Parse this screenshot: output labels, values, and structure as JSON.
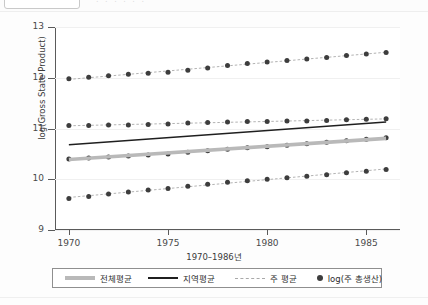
{
  "chart_data": {
    "type": "scatter",
    "title": "",
    "xlabel": "1970–1986년",
    "ylabel": "log(Gross State Product)",
    "xlim": [
      1969.3,
      1986.7
    ],
    "ylim": [
      9,
      13
    ],
    "x": [
      1970,
      1971,
      1972,
      1973,
      1974,
      1975,
      1976,
      1977,
      1978,
      1979,
      1980,
      1981,
      1982,
      1983,
      1984,
      1985,
      1986
    ],
    "xticks": [
      "1970",
      "1975",
      "1980",
      "1985"
    ],
    "xtick_values": [
      1970,
      1975,
      1980,
      1985
    ],
    "yticks": [
      "9",
      "10",
      "11",
      "12",
      "13"
    ],
    "ytick_values": [
      9,
      10,
      11,
      12,
      13
    ],
    "grid": true,
    "legend_position": "bottom",
    "series": [
      {
        "name": "log(주 총생산)",
        "type": "scatter-with-dashed-fit",
        "group": "region-1",
        "values": [
          11.98,
          12.01,
          12.04,
          12.07,
          12.09,
          12.11,
          12.15,
          12.19,
          12.24,
          12.28,
          12.31,
          12.34,
          12.37,
          12.4,
          12.44,
          12.47,
          12.5
        ]
      },
      {
        "name": "log(주 총생산)",
        "type": "scatter-with-dashed-fit",
        "group": "region-2",
        "values": [
          11.06,
          11.06,
          11.07,
          11.07,
          11.08,
          11.09,
          11.11,
          11.12,
          11.13,
          11.14,
          11.14,
          11.15,
          11.15,
          11.16,
          11.17,
          11.18,
          11.19
        ]
      },
      {
        "name": "log(주 총생산)",
        "type": "scatter-with-dashed-fit",
        "group": "region-3",
        "values": [
          10.4,
          10.42,
          10.44,
          10.46,
          10.48,
          10.5,
          10.53,
          10.56,
          10.59,
          10.62,
          10.64,
          10.67,
          10.7,
          10.73,
          10.76,
          10.79,
          10.82
        ]
      },
      {
        "name": "log(주 총생산)",
        "type": "scatter-with-dashed-fit",
        "group": "region-4",
        "values": [
          9.62,
          9.66,
          9.71,
          9.75,
          9.79,
          9.82,
          9.86,
          9.9,
          9.94,
          9.97,
          10.0,
          10.03,
          10.06,
          10.09,
          10.13,
          10.16,
          10.19
        ]
      },
      {
        "name": "전체평균",
        "type": "line-thick-gray",
        "values": [
          10.39,
          10.42,
          10.44,
          10.47,
          10.49,
          10.52,
          10.55,
          10.57,
          10.6,
          10.62,
          10.65,
          10.68,
          10.7,
          10.73,
          10.75,
          10.78,
          10.81
        ]
      },
      {
        "name": "지역평균",
        "type": "line-black",
        "values": [
          10.68,
          10.71,
          10.74,
          10.76,
          10.79,
          10.82,
          10.85,
          10.88,
          10.9,
          10.93,
          10.96,
          10.99,
          11.01,
          11.04,
          11.07,
          11.1,
          11.13
        ]
      }
    ]
  },
  "axes": {
    "y_title": "log(Gross State Product)",
    "x_title": "1970–1986년",
    "y_labels": [
      "13",
      "12",
      "11",
      "10",
      "9"
    ],
    "x_labels": [
      "1970",
      "1975",
      "1980",
      "1985"
    ]
  },
  "legend": {
    "items": [
      {
        "key": "thick-gray-line",
        "label": "전체평균"
      },
      {
        "key": "black-line",
        "label": "지역평균"
      },
      {
        "key": "dashed-line",
        "label": "주 평균"
      },
      {
        "key": "dot-marker",
        "label": "log(주 총생산)"
      }
    ]
  },
  "colors": {
    "overall_mean": "#b9b9b9",
    "region_mean": "#1f1f1f",
    "state_mean": "#a9a9a9",
    "points": "#3d3d3d",
    "axis": "#5a5a5a",
    "grid": "#f0f0f0"
  }
}
